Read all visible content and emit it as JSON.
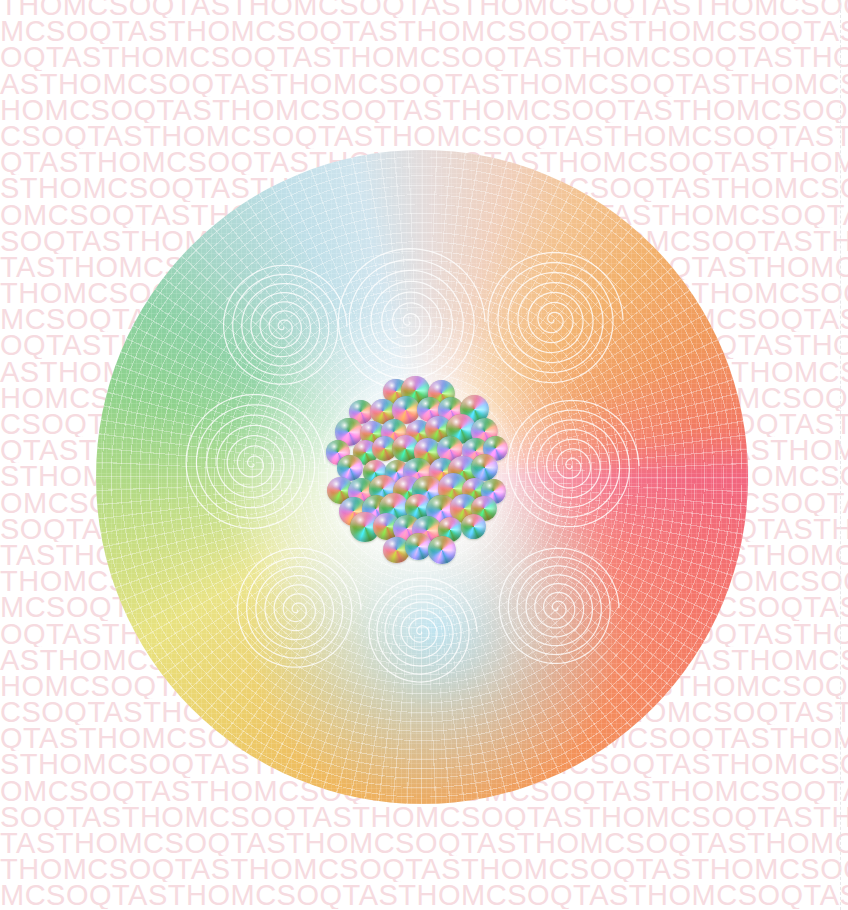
{
  "canvas": {
    "width": 848,
    "height": 910,
    "background_color": "#ffffff"
  },
  "background_text": {
    "repeat_unit": "THOMCSOQTAS",
    "full_sample_line": "THOMCSOQTASTHOMCSOQTASTHOMCSOQTASTHOMCSOQTASTHOMCSOQTAS",
    "color": "#f6dbe0",
    "font_size_px": 29,
    "line_height_px": 26,
    "row_count": 36,
    "letters": [
      "T",
      "H",
      "O",
      "M",
      "C",
      "S",
      "O",
      "Q",
      "T",
      "A",
      "S"
    ]
  },
  "right_guide": {
    "style": "dashed",
    "color": "#e7e7ea",
    "x": 840
  },
  "orb": {
    "label": "rainbow-sphere",
    "center_x": 422,
    "center_y": 477,
    "radius": 375,
    "ring_colors": [
      "#573c54",
      "#6d4a68",
      "#8e6a93",
      "#9d7fae",
      "#7c5f97",
      "#5a4a86",
      "#4c5d96",
      "#6f8fb5",
      "#7ab3c0",
      "#7fc4a0",
      "#96cf8f",
      "#c9dd86",
      "#ebe07c",
      "#efc768",
      "#f2a85d",
      "#f4915e",
      "#f4806a",
      "#f06a82"
    ],
    "field_hues": [
      "#f2657f",
      "#f4865f",
      "#f0b059",
      "#e8e27f",
      "#8ed28c",
      "#a9d7cd",
      "#cfe4ee",
      "#f3c28e",
      "#f0975a",
      "#f27b63"
    ],
    "mesh": {
      "type": "polar-grid",
      "ring_spacing_px": 9,
      "spoke_step_deg": 2.5,
      "stroke": "rgba(255,255,255,0.42)"
    }
  },
  "spirals": {
    "stroke": "rgba(255,255,255,0.80)",
    "turns": 7,
    "items": [
      {
        "cx": 286,
        "cy": 331,
        "r": 64
      },
      {
        "cx": 412,
        "cy": 326,
        "r": 76
      },
      {
        "cx": 556,
        "cy": 324,
        "r": 70
      },
      {
        "cx": 256,
        "cy": 468,
        "r": 72
      },
      {
        "cx": 574,
        "cy": 470,
        "r": 68
      },
      {
        "cx": 300,
        "cy": 614,
        "r": 64
      },
      {
        "cx": 424,
        "cy": 636,
        "r": 56
      },
      {
        "cx": 560,
        "cy": 612,
        "r": 62
      }
    ]
  },
  "bead_cluster": {
    "label": "iridescent-bead-cluster",
    "center_x": 418,
    "center_y": 470,
    "cluster_radius": 88,
    "bead_count": 52,
    "bead_diameter_px": 27,
    "palette": [
      "#f2d24e",
      "#e86aa8",
      "#3f6fc0",
      "#2f8fb8",
      "#5fc0b0",
      "#c8e07a",
      "#f2b45e",
      "#ef7f7f"
    ]
  }
}
